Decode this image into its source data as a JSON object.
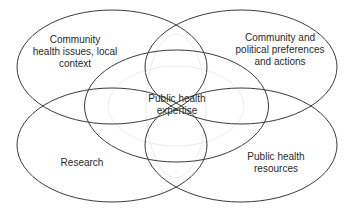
{
  "diagram": {
    "type": "venn-ellipses",
    "colors": {
      "stroke": "#3a3a3a",
      "text": "#2a2a2a",
      "background": "#ffffff"
    },
    "nodes": [
      {
        "id": "community-health",
        "lines": [
          "Community",
          "health issues, local",
          "context"
        ],
        "position": "top-left"
      },
      {
        "id": "community-political",
        "lines": [
          "Community and",
          "political preferences",
          "and actions"
        ],
        "position": "top-right"
      },
      {
        "id": "research",
        "lines": [
          "Research"
        ],
        "position": "bottom-left"
      },
      {
        "id": "public-health-resources",
        "lines": [
          "Public health",
          "resources"
        ],
        "position": "bottom-right"
      },
      {
        "id": "public-health-expertise",
        "lines": [
          "Public health",
          "expertise"
        ],
        "position": "center"
      }
    ]
  }
}
